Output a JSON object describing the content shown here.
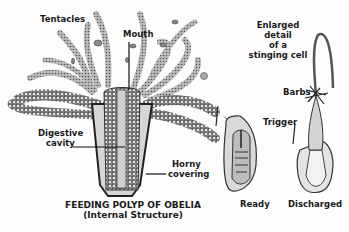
{
  "labels": {
    "tentacles": "Tentacles",
    "mouth": "Mouth",
    "digestive_1": "Digestive",
    "digestive_2": "cavity",
    "horny_1": "Horny",
    "horny_2": "covering",
    "enlarged_1": "Enlarged",
    "enlarged_2": "detail",
    "enlarged_3": "of a",
    "enlarged_4": "stinging cell",
    "barbs": "Barbs",
    "trigger": "Trigger",
    "ready": "Ready",
    "discharged": "Discharged"
  },
  "caption": {
    "title": "FEEDING POLYP OF OBELIA",
    "subtitle": "(Internal Structure)"
  },
  "colors": {
    "ink": "#1a1a1a",
    "shade": "#9a9a9a",
    "fill": "#d8d8d8",
    "arrow": "#8a8a8a"
  }
}
